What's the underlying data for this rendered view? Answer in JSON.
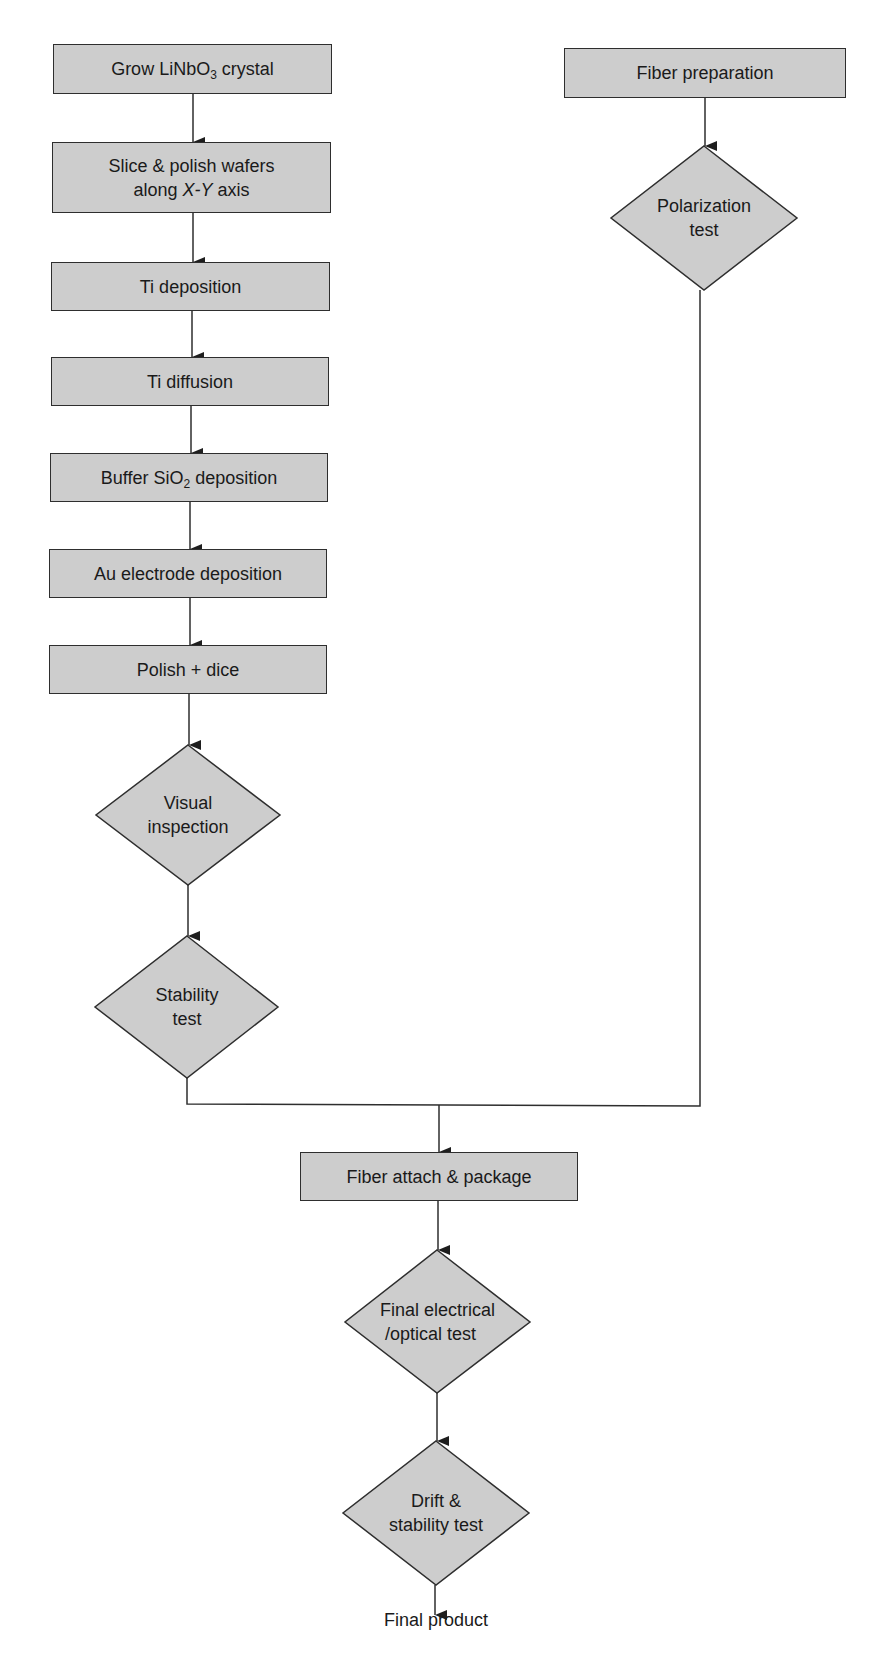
{
  "diagram": {
    "type": "process-flowchart",
    "colors": {
      "node_fill": "#cdcdcd",
      "node_border": "#2e2e2e",
      "line": "#2e2e2e",
      "text": "#1a1a1a",
      "background": "#ffffff"
    },
    "main_branch": {
      "steps": [
        {
          "id": "grow",
          "shape": "rectangle",
          "label_pre": "Grow LiNbO",
          "label_sub": "3",
          "label_post": " crystal"
        },
        {
          "id": "slice",
          "shape": "rectangle",
          "line1": "Slice & polish wafers",
          "line2_pre": "along ",
          "line2_italic": "X-Y",
          "line2_post": " axis"
        },
        {
          "id": "ti-dep",
          "shape": "rectangle",
          "label": "Ti deposition"
        },
        {
          "id": "ti-diff",
          "shape": "rectangle",
          "label": "Ti diffusion"
        },
        {
          "id": "buffer",
          "shape": "rectangle",
          "label_pre": "Buffer SiO",
          "label_sub": "2",
          "label_post": " deposition"
        },
        {
          "id": "au",
          "shape": "rectangle",
          "label": "Au electrode deposition"
        },
        {
          "id": "polish",
          "shape": "rectangle",
          "label": "Polish + dice"
        },
        {
          "id": "visual",
          "shape": "diamond",
          "line1": "Visual",
          "line2": "inspection"
        },
        {
          "id": "stability",
          "shape": "diamond",
          "line1": "Stability",
          "line2": "test"
        }
      ]
    },
    "fiber_branch": {
      "steps": [
        {
          "id": "fiber-prep",
          "shape": "rectangle",
          "label": "Fiber preparation"
        },
        {
          "id": "polarization",
          "shape": "diamond",
          "line1": "Polarization",
          "line2": "test"
        }
      ]
    },
    "merged_branch": {
      "steps": [
        {
          "id": "fiber-attach",
          "shape": "rectangle",
          "label": "Fiber attach & package"
        },
        {
          "id": "final-test",
          "shape": "diamond",
          "line1": "Final electrical",
          "line2": "/optical test"
        },
        {
          "id": "drift",
          "shape": "diamond",
          "line1": "Drift &",
          "line2": "stability test"
        }
      ],
      "terminal": {
        "label": "Final product"
      }
    },
    "edges": [
      {
        "from": "grow",
        "to": "slice"
      },
      {
        "from": "slice",
        "to": "ti-dep"
      },
      {
        "from": "ti-dep",
        "to": "ti-diff"
      },
      {
        "from": "ti-diff",
        "to": "buffer"
      },
      {
        "from": "buffer",
        "to": "au"
      },
      {
        "from": "au",
        "to": "polish"
      },
      {
        "from": "polish",
        "to": "visual"
      },
      {
        "from": "visual",
        "to": "stability"
      },
      {
        "from": "stability",
        "to": "fiber-attach"
      },
      {
        "from": "fiber-prep",
        "to": "polarization"
      },
      {
        "from": "polarization",
        "to": "fiber-attach"
      },
      {
        "from": "fiber-attach",
        "to": "final-test"
      },
      {
        "from": "final-test",
        "to": "drift"
      },
      {
        "from": "drift",
        "to": "final-product"
      }
    ]
  }
}
